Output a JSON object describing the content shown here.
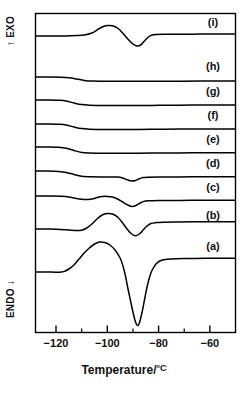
{
  "figure": {
    "type": "dsc-thermogram",
    "y_axis": {
      "top_label": "EXO",
      "top_arrow": "up-arrow-icon",
      "bottom_label": "ENDO",
      "bottom_arrow": "down-arrow-icon"
    },
    "x_axis": {
      "title": "Temperature/",
      "unit": "°C",
      "ticks": [
        "-120",
        "-100",
        "-80",
        "-60"
      ],
      "tick_values": [
        -120,
        -100,
        -80,
        -60
      ],
      "range": [
        -128,
        -50
      ],
      "minor_ticks": [
        -110,
        -90,
        -70
      ]
    },
    "curve_labels": [
      "(a)",
      "(b)",
      "(c)",
      "(d)",
      "(e)",
      "(f)",
      "(g)",
      "(h)",
      "(i)"
    ],
    "colors": {
      "line": "#000000",
      "frame": "#000000",
      "background": "#ffffff"
    }
  },
  "chart_data": {
    "type": "line",
    "title": "",
    "xlabel": "Temperature/°C",
    "ylabel": "Heat flow (EXO up / ENDO down)",
    "xlim": [
      -128,
      -50
    ],
    "grid": false,
    "legend": "right-inline",
    "xticks": [
      -120,
      -100,
      -80,
      -60
    ],
    "xticklabels": [
      "-120",
      "-100",
      "-80",
      "-60"
    ],
    "series": [
      {
        "name": "(i)",
        "label": "(i)",
        "baseline_y": 36,
        "features": [
          {
            "kind": "exothermic-peak",
            "x": -101,
            "amplitude": 12
          },
          {
            "kind": "endothermic-peak",
            "x": -89,
            "amplitude": 14
          }
        ],
        "points": [
          [
            -128,
            36
          ],
          [
            -122,
            36
          ],
          [
            -116,
            36
          ],
          [
            -112,
            35.6
          ],
          [
            -109,
            35
          ],
          [
            -106,
            33
          ],
          [
            -104,
            30
          ],
          [
            -102,
            27
          ],
          [
            -100,
            25.5
          ],
          [
            -98,
            25.8
          ],
          [
            -96,
            28
          ],
          [
            -94,
            33
          ],
          [
            -92,
            39
          ],
          [
            -90,
            44
          ],
          [
            -88.5,
            46
          ],
          [
            -87,
            45
          ],
          [
            -85.5,
            41
          ],
          [
            -84,
            37
          ],
          [
            -82.5,
            35
          ],
          [
            -81,
            34.5
          ],
          [
            -78,
            34.3
          ],
          [
            -72,
            34.2
          ],
          [
            -64,
            34.1
          ],
          [
            -56,
            34
          ],
          [
            -50,
            34
          ]
        ]
      },
      {
        "name": "(h)",
        "label": "(h)",
        "baseline_y": 80,
        "features": [
          {
            "kind": "baseline-step",
            "x": -112,
            "amplitude": 4
          }
        ],
        "points": [
          [
            -128,
            77
          ],
          [
            -122,
            77
          ],
          [
            -118,
            77.2
          ],
          [
            -115,
            77.8
          ],
          [
            -112,
            79
          ],
          [
            -109,
            80.4
          ],
          [
            -106,
            81
          ],
          [
            -100,
            81.2
          ],
          [
            -92,
            81.3
          ],
          [
            -84,
            81.3
          ],
          [
            -74,
            81.2
          ],
          [
            -64,
            81.1
          ],
          [
            -56,
            81
          ],
          [
            -50,
            81
          ]
        ]
      },
      {
        "name": "(g)",
        "label": "(g)",
        "baseline_y": 104,
        "features": [
          {
            "kind": "baseline-step",
            "x": -113,
            "amplitude": 5
          }
        ],
        "points": [
          [
            -128,
            100
          ],
          [
            -123,
            100
          ],
          [
            -119,
            100.3
          ],
          [
            -116,
            101
          ],
          [
            -113,
            103
          ],
          [
            -110,
            104.6
          ],
          [
            -107,
            105.2
          ],
          [
            -102,
            105.4
          ],
          [
            -95,
            105.5
          ],
          [
            -88,
            105.6
          ],
          [
            -80,
            105.3
          ],
          [
            -72,
            105.2
          ],
          [
            -62,
            105
          ],
          [
            -54,
            105
          ],
          [
            -50,
            105
          ]
        ]
      },
      {
        "name": "(f)",
        "label": "(f)",
        "baseline_y": 128,
        "features": [
          {
            "kind": "baseline-step",
            "x": -113,
            "amplitude": 5
          }
        ],
        "points": [
          [
            -128,
            124
          ],
          [
            -123,
            124
          ],
          [
            -119,
            124.3
          ],
          [
            -116,
            125
          ],
          [
            -113,
            127
          ],
          [
            -110,
            128.6
          ],
          [
            -107,
            129.2
          ],
          [
            -102,
            129.4
          ],
          [
            -95,
            129.5
          ],
          [
            -88,
            129.4
          ],
          [
            -80,
            129.2
          ],
          [
            -72,
            129.1
          ],
          [
            -62,
            129
          ],
          [
            -54,
            129
          ],
          [
            -50,
            129
          ]
        ]
      },
      {
        "name": "(e)",
        "label": "(e)",
        "baseline_y": 152,
        "features": [
          {
            "kind": "baseline-step",
            "x": -113,
            "amplitude": 6
          }
        ],
        "points": [
          [
            -128,
            147
          ],
          [
            -123,
            147
          ],
          [
            -119,
            147.3
          ],
          [
            -116,
            148.2
          ],
          [
            -113,
            150.5
          ],
          [
            -110,
            152.4
          ],
          [
            -107,
            153
          ],
          [
            -102,
            153.2
          ],
          [
            -95,
            153.3
          ],
          [
            -88,
            153.2
          ],
          [
            -80,
            153
          ],
          [
            -72,
            152.9
          ],
          [
            -62,
            152.8
          ],
          [
            -54,
            152.8
          ],
          [
            -50,
            152.8
          ]
        ]
      },
      {
        "name": "(d)",
        "label": "(d)",
        "baseline_y": 176,
        "features": [
          {
            "kind": "baseline-step",
            "x": -113,
            "amplitude": 6
          },
          {
            "kind": "endothermic-peak",
            "x": -91,
            "amplitude": 5
          }
        ],
        "points": [
          [
            -128,
            171
          ],
          [
            -123,
            171
          ],
          [
            -119,
            171.4
          ],
          [
            -116,
            172.4
          ],
          [
            -113,
            174.5
          ],
          [
            -110,
            176.2
          ],
          [
            -106,
            176.8
          ],
          [
            -100,
            177
          ],
          [
            -96,
            177.1
          ],
          [
            -94,
            178
          ],
          [
            -92,
            180
          ],
          [
            -90.5,
            181
          ],
          [
            -89,
            180.5
          ],
          [
            -87.5,
            178.8
          ],
          [
            -86,
            177.6
          ],
          [
            -84,
            177.2
          ],
          [
            -80,
            177
          ],
          [
            -72,
            176.9
          ],
          [
            -62,
            176.8
          ],
          [
            -54,
            176.8
          ],
          [
            -50,
            176.8
          ]
        ]
      },
      {
        "name": "(c)",
        "label": "(c)",
        "baseline_y": 201,
        "features": [
          {
            "kind": "exothermic-peak",
            "x": -102,
            "amplitude": 5
          },
          {
            "kind": "endothermic-peak",
            "x": -90,
            "amplitude": 8
          }
        ],
        "points": [
          [
            -128,
            196
          ],
          [
            -122,
            196
          ],
          [
            -118,
            196.3
          ],
          [
            -115,
            197
          ],
          [
            -112,
            198.6
          ],
          [
            -109,
            199.6
          ],
          [
            -106,
            199
          ],
          [
            -104,
            197.6
          ],
          [
            -102,
            196.6
          ],
          [
            -100,
            196.4
          ],
          [
            -98,
            197
          ],
          [
            -96,
            199
          ],
          [
            -94,
            202
          ],
          [
            -92,
            205
          ],
          [
            -90.5,
            206.5
          ],
          [
            -89,
            205.8
          ],
          [
            -87.5,
            203.5
          ],
          [
            -86,
            201.6
          ],
          [
            -84,
            200.8
          ],
          [
            -80,
            200.5
          ],
          [
            -72,
            200.4
          ],
          [
            -62,
            200.3
          ],
          [
            -54,
            200.3
          ],
          [
            -50,
            200.3
          ]
        ]
      },
      {
        "name": "(b)",
        "label": "(b)",
        "baseline_y": 234,
        "features": [
          {
            "kind": "exothermic-peak",
            "x": -101,
            "amplitude": 17
          },
          {
            "kind": "endothermic-peak",
            "x": -89,
            "amplitude": 20
          }
        ],
        "points": [
          [
            -128,
            229
          ],
          [
            -122,
            229
          ],
          [
            -118,
            229.4
          ],
          [
            -115,
            230
          ],
          [
            -112,
            230.6
          ],
          [
            -110,
            230.2
          ],
          [
            -108,
            228
          ],
          [
            -106,
            224
          ],
          [
            -104,
            219
          ],
          [
            -102,
            215
          ],
          [
            -100,
            213.5
          ],
          [
            -98,
            214
          ],
          [
            -96,
            217
          ],
          [
            -94,
            223
          ],
          [
            -92,
            230
          ],
          [
            -90.5,
            234
          ],
          [
            -89,
            235.8
          ],
          [
            -87.5,
            234
          ],
          [
            -86,
            230
          ],
          [
            -84.5,
            226
          ],
          [
            -83,
            223.5
          ],
          [
            -81,
            222.6
          ],
          [
            -78,
            222.2
          ],
          [
            -72,
            222
          ],
          [
            -64,
            221.8
          ],
          [
            -56,
            221.7
          ],
          [
            -50,
            221.7
          ]
        ]
      },
      {
        "name": "(a)",
        "label": "(a)",
        "baseline_y": 270,
        "features": [
          {
            "kind": "exothermic-peak",
            "x": -103,
            "amplitude": 26
          },
          {
            "kind": "endothermic-peak",
            "x": -88,
            "amplitude": 60
          }
        ],
        "points": [
          [
            -128,
            272
          ],
          [
            -122,
            272
          ],
          [
            -119,
            272.2
          ],
          [
            -117,
            271.6
          ],
          [
            -115,
            269
          ],
          [
            -113,
            265
          ],
          [
            -111,
            259
          ],
          [
            -109,
            253
          ],
          [
            -107,
            248
          ],
          [
            -105,
            244
          ],
          [
            -103,
            242
          ],
          [
            -101,
            242.5
          ],
          [
            -99,
            245
          ],
          [
            -97,
            250
          ],
          [
            -95,
            258
          ],
          [
            -94,
            265
          ],
          [
            -93,
            275
          ],
          [
            -92,
            288
          ],
          [
            -91,
            300
          ],
          [
            -90,
            312
          ],
          [
            -89,
            322
          ],
          [
            -88.2,
            325.5
          ],
          [
            -87.5,
            323
          ],
          [
            -86.5,
            313
          ],
          [
            -85.5,
            300
          ],
          [
            -84.5,
            287
          ],
          [
            -83.5,
            277
          ],
          [
            -82.5,
            270
          ],
          [
            -81,
            264
          ],
          [
            -79.5,
            261
          ],
          [
            -78,
            259.8
          ],
          [
            -75,
            259
          ],
          [
            -70,
            258.6
          ],
          [
            -62,
            258.3
          ],
          [
            -56,
            258.2
          ],
          [
            -50,
            258.2
          ]
        ]
      }
    ]
  }
}
